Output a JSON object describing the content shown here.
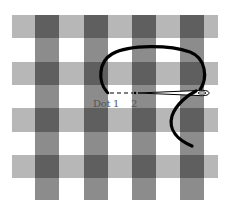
{
  "diagram": {
    "type": "gingham-embroidery-stitch",
    "colors": {
      "background": "#ffffff",
      "light_band": "#b7b7b7",
      "vertical_band": "#8c8c8c",
      "dark_intersection": "#5f5f5f",
      "thread": "#000000",
      "needle_fill": "#ffffff",
      "needle_outline": "#000000"
    },
    "grid": {
      "x_extent": [
        12,
        218
      ],
      "y_extent": [
        15,
        200
      ],
      "vertical_bands": [
        [
          35,
          59
        ],
        [
          84,
          108
        ],
        [
          132,
          156
        ],
        [
          180,
          204
        ]
      ],
      "horizontal_bands": [
        [
          15,
          38
        ],
        [
          62,
          85
        ],
        [
          108,
          132
        ],
        [
          155,
          178
        ]
      ]
    },
    "points": [
      {
        "id": "dot1",
        "label": "Dot 1",
        "x": 108,
        "y": 93
      },
      {
        "id": "dot2",
        "label": "2",
        "x": 135,
        "y": 93
      }
    ],
    "labels": {
      "dot1": "Dot 1",
      "dot2": "2"
    }
  }
}
